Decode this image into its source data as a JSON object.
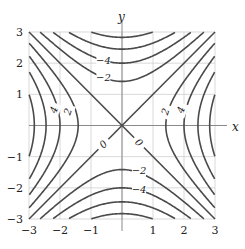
{
  "chart_data": {
    "type": "contour",
    "function": "x^2 - y^2",
    "xlabel": "x",
    "ylabel": "y",
    "xlim": [
      -3,
      3
    ],
    "ylim": [
      -3,
      3
    ],
    "grid": true,
    "xticks": [
      -3,
      -2,
      -1,
      1,
      2,
      3
    ],
    "yticks": [
      -3,
      -2,
      -1,
      1,
      2,
      3
    ],
    "levels": [
      -8,
      -6,
      -4,
      -2,
      0,
      2,
      4,
      6,
      8
    ],
    "contour_labels": [
      {
        "text": "-4",
        "x": -0.6,
        "y": 2.1
      },
      {
        "text": "-2",
        "x": -0.6,
        "y": 1.55
      },
      {
        "text": "2",
        "x": -1.75,
        "y": 0.45,
        "rot": -70
      },
      {
        "text": "4",
        "x": -2.2,
        "y": 0.5,
        "rot": -70
      },
      {
        "text": "0",
        "x": -0.6,
        "y": -0.6,
        "rot": -45
      },
      {
        "text": "2",
        "x": 1.4,
        "y": 0.45,
        "rot": -70
      },
      {
        "text": "4",
        "x": 1.9,
        "y": 0.5,
        "rot": -70
      },
      {
        "text": "0",
        "x": 0.55,
        "y": -0.55,
        "rot": 45
      },
      {
        "text": "-2",
        "x": 0.55,
        "y": -1.45
      },
      {
        "text": "-4",
        "x": 0.55,
        "y": -2.05
      }
    ]
  }
}
